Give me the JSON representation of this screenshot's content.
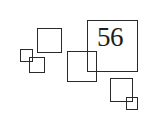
{
  "diagram": {
    "label": "56",
    "stroke_color": "#2a2a2a",
    "squares": [
      {
        "id": "square-upper-left",
        "x": 37,
        "y": 28,
        "w": 24,
        "h": 25
      },
      {
        "id": "square-small-left",
        "x": 20,
        "y": 49,
        "w": 12,
        "h": 13
      },
      {
        "id": "square-small-left-overlap",
        "x": 29,
        "y": 57,
        "w": 16,
        "h": 16
      },
      {
        "id": "square-large-labeled",
        "x": 87,
        "y": 20,
        "w": 51,
        "h": 52
      },
      {
        "id": "square-middle",
        "x": 67,
        "y": 51,
        "w": 30,
        "h": 31
      },
      {
        "id": "square-lower-right",
        "x": 110,
        "y": 78,
        "w": 23,
        "h": 24
      },
      {
        "id": "square-tiny-lower-right",
        "x": 126,
        "y": 97,
        "w": 12,
        "h": 13
      }
    ]
  }
}
